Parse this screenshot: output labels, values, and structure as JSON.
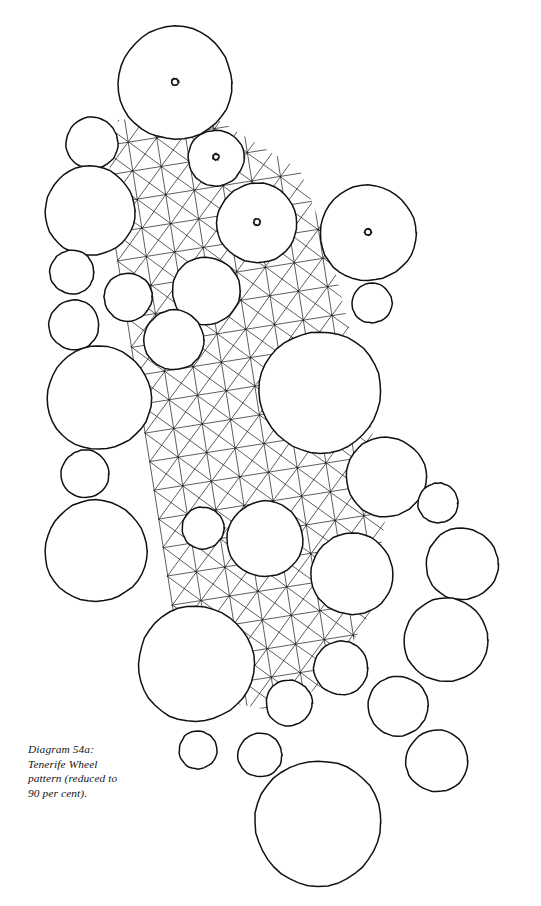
{
  "page": {
    "width": 541,
    "height": 906,
    "background_color": "#ffffff",
    "ink_color": "#111111",
    "lattice_color": "#1a1a1a"
  },
  "caption": {
    "text": "Diagram 54a:\nTenerife Wheel\npattern (reduced to\n90 per cent).",
    "lines": [
      "Diagram 54a:",
      "Tenerife Wheel",
      "pattern (reduced to",
      "90 per cent)."
    ],
    "label": "Diagram 54a",
    "title": "Tenerife Wheel pattern",
    "note": "reduced to 90 per cent",
    "style": "italic-serif"
  },
  "figure": {
    "title": "Tenerife Wheel pattern",
    "lattice": {
      "angle_deg": -9,
      "cell_size": 29,
      "cols": 12,
      "rows": 22,
      "origin_x": 95,
      "origin_y": 118,
      "diagonals": "both",
      "stroke_width": 0.7
    },
    "clip_band": {
      "description": "lattice visible only inside the diagonal band of the motif",
      "points": "118,120 205,112 300,170 330,250 352,340 372,430 385,520 372,610 330,680 280,712 215,700 165,640 140,560 125,470 112,380 100,290 104,200"
    },
    "knot_marks": [
      {
        "cx": 175,
        "cy": 82,
        "r": 3.4
      },
      {
        "cx": 216,
        "cy": 157,
        "r": 3.0
      },
      {
        "cx": 257,
        "cy": 222,
        "r": 3.2
      },
      {
        "cx": 368,
        "cy": 232,
        "r": 3.2
      }
    ],
    "circles": [
      {
        "cx": 175,
        "cy": 83,
        "r": 57,
        "size": "large"
      },
      {
        "cx": 92,
        "cy": 143,
        "r": 26,
        "size": "small"
      },
      {
        "cx": 216,
        "cy": 158,
        "r": 28,
        "size": "small"
      },
      {
        "cx": 90,
        "cy": 211,
        "r": 45,
        "size": "medium"
      },
      {
        "cx": 257,
        "cy": 223,
        "r": 40,
        "size": "medium"
      },
      {
        "cx": 368,
        "cy": 233,
        "r": 48,
        "size": "large"
      },
      {
        "cx": 72,
        "cy": 272,
        "r": 22,
        "size": "small"
      },
      {
        "cx": 128,
        "cy": 297,
        "r": 24,
        "size": "small"
      },
      {
        "cx": 206,
        "cy": 291,
        "r": 34,
        "size": "medium"
      },
      {
        "cx": 372,
        "cy": 303,
        "r": 20,
        "size": "small"
      },
      {
        "cx": 74,
        "cy": 325,
        "r": 25,
        "size": "small"
      },
      {
        "cx": 174,
        "cy": 340,
        "r": 30,
        "size": "medium"
      },
      {
        "cx": 99,
        "cy": 398,
        "r": 52,
        "size": "large"
      },
      {
        "cx": 320,
        "cy": 392,
        "r": 61,
        "size": "large"
      },
      {
        "cx": 386,
        "cy": 477,
        "r": 40,
        "size": "medium"
      },
      {
        "cx": 85,
        "cy": 474,
        "r": 24,
        "size": "small"
      },
      {
        "cx": 438,
        "cy": 503,
        "r": 20,
        "size": "small"
      },
      {
        "cx": 96,
        "cy": 551,
        "r": 51,
        "size": "large"
      },
      {
        "cx": 203,
        "cy": 528,
        "r": 21,
        "size": "small"
      },
      {
        "cx": 265,
        "cy": 539,
        "r": 38,
        "size": "medium"
      },
      {
        "cx": 462,
        "cy": 564,
        "r": 36,
        "size": "medium"
      },
      {
        "cx": 352,
        "cy": 574,
        "r": 41,
        "size": "medium"
      },
      {
        "cx": 446,
        "cy": 640,
        "r": 42,
        "size": "medium"
      },
      {
        "cx": 196,
        "cy": 664,
        "r": 58,
        "size": "large"
      },
      {
        "cx": 341,
        "cy": 668,
        "r": 27,
        "size": "small"
      },
      {
        "cx": 289,
        "cy": 703,
        "r": 23,
        "size": "small"
      },
      {
        "cx": 398,
        "cy": 706,
        "r": 30,
        "size": "medium"
      },
      {
        "cx": 198,
        "cy": 750,
        "r": 19,
        "size": "small"
      },
      {
        "cx": 260,
        "cy": 755,
        "r": 22,
        "size": "small"
      },
      {
        "cx": 437,
        "cy": 761,
        "r": 31,
        "size": "medium"
      },
      {
        "cx": 318,
        "cy": 823,
        "r": 63,
        "size": "large"
      }
    ]
  }
}
